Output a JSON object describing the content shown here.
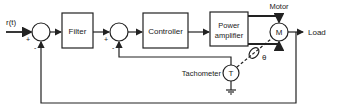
{
  "diagram": {
    "type": "block-diagram",
    "input_label": "r(t)",
    "blocks": {
      "filter": "Filter",
      "controller": "Controller",
      "power_amp_line1": "Power",
      "power_amp_line2": "amplifier"
    },
    "motor": {
      "label": "Motor",
      "symbol": "M"
    },
    "tachometer": {
      "label": "Tachometer",
      "symbol": "T"
    },
    "theta": "θ",
    "output_label": "Load",
    "signs": {
      "s1_plus": "+",
      "s1_minus": "-",
      "s2_plus": "+",
      "s2_minus": "-"
    }
  }
}
